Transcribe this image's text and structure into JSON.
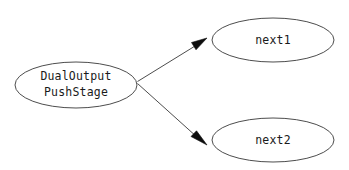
{
  "diagram": {
    "type": "directed-graph",
    "background_color": "#ffffff",
    "node_fill_color": "#ffffff",
    "node_stroke_color": "#4d4d4d",
    "edge_color": "#4d4d4d",
    "arrowhead_color": "#0d0d0d",
    "text_color": "#1a1a1a",
    "nodes": [
      {
        "id": "source",
        "shape": "ellipse",
        "label_line1": "DualOutput",
        "label_line2": "PushStage",
        "cx": 76,
        "cy": 85,
        "rx": 61,
        "ry": 23
      },
      {
        "id": "next1",
        "shape": "ellipse",
        "label_line1": "next1",
        "label_line2": "",
        "cx": 273,
        "cy": 40,
        "rx": 61,
        "ry": 22
      },
      {
        "id": "next2",
        "shape": "ellipse",
        "label_line1": "next2",
        "label_line2": "",
        "cx": 273,
        "cy": 140,
        "rx": 61,
        "ry": 22
      }
    ],
    "edges": [
      {
        "id": "source-to-next1",
        "from": "source",
        "to": "next1",
        "label": "",
        "path": "M137.5,81.5 L197.5,44.5",
        "arrow_points": "207,38 191.5,42.5 196,49.8"
      },
      {
        "id": "source-to-next2",
        "from": "source",
        "to": "next2",
        "label": "",
        "path": "M137.5,83.5 L197.5,137.5",
        "arrow_points": "207,145 191,136.5 196.5,130.8"
      }
    ]
  }
}
